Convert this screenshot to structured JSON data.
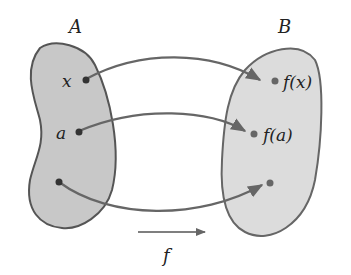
{
  "diagram": {
    "set_a": {
      "label": "A",
      "fill": "#c8c8c8",
      "stroke": "#555555"
    },
    "set_b": {
      "label": "B",
      "fill": "#dcdcdc",
      "stroke": "#666666"
    },
    "points_a": [
      {
        "label": "x"
      },
      {
        "label": "a"
      },
      {
        "label": ""
      }
    ],
    "points_b": [
      {
        "label": "f(x)"
      },
      {
        "label": "f(a)"
      },
      {
        "label": ""
      }
    ],
    "function_label": "f",
    "arrow_color": "#666666"
  }
}
